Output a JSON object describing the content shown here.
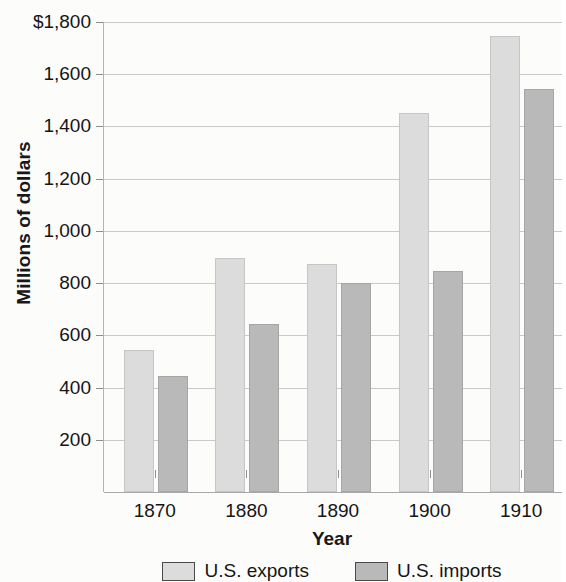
{
  "chart_data": {
    "type": "bar",
    "title": "",
    "xlabel": "Year",
    "ylabel": "Millions of dollars",
    "categories": [
      "1870",
      "1880",
      "1890",
      "1900",
      "1910"
    ],
    "series": [
      {
        "name": "U.S. exports",
        "values": [
          545,
          895,
          875,
          1450,
          1745
        ],
        "color": "#dcdcdc"
      },
      {
        "name": "U.S. imports",
        "values": [
          445,
          645,
          800,
          845,
          1545
        ],
        "color": "#b9b9b9"
      }
    ],
    "ylim": [
      0,
      1800
    ],
    "ytick_values": [
      200,
      400,
      600,
      800,
      1000,
      1200,
      1400,
      1600,
      1800
    ],
    "ytick_labels": [
      "200",
      "400",
      "600",
      "800",
      "1,000",
      "1,200",
      "1,400",
      "1,600",
      "$1,800"
    ],
    "grid": true,
    "legend_position": "bottom"
  },
  "axes": {
    "y_title": "Millions of dollars",
    "x_title": "Year"
  },
  "legend": {
    "items": [
      {
        "label": "U.S. exports",
        "color": "#dcdcdc"
      },
      {
        "label": "U.S. imports",
        "color": "#b9b9b9"
      }
    ]
  }
}
